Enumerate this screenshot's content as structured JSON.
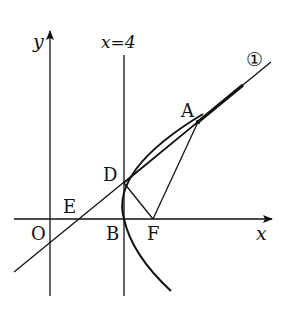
{
  "diagram": {
    "type": "coordinate-geometry",
    "labels": {
      "y_axis": "y",
      "x_axis": "x",
      "vertical_line": "x=4",
      "line_marker": "①",
      "origin": "O",
      "E": "E",
      "B": "B",
      "F": "F",
      "D": "D",
      "A": "A"
    },
    "points": {
      "O": [
        50,
        219
      ],
      "E": [
        79,
        219
      ],
      "B": [
        124,
        219
      ],
      "F": [
        153,
        219
      ],
      "D": [
        124,
        183
      ],
      "A": [
        198,
        122
      ]
    },
    "colors": {
      "stroke": "#111111",
      "background": "#ffffff"
    }
  }
}
